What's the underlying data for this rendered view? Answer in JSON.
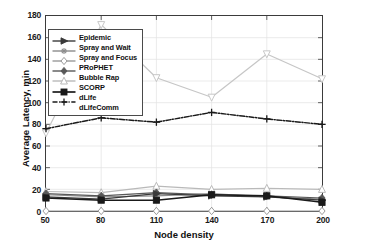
{
  "chart_data": {
    "type": "line",
    "title": "",
    "xlabel": "Node density",
    "ylabel": "Average Latency, min",
    "x": [
      50,
      80,
      110,
      140,
      170,
      200
    ],
    "xticklabels": [
      "50",
      "80",
      "110",
      "140",
      "170",
      "200"
    ],
    "yticklabels": [
      "0",
      "20",
      "40",
      "60",
      "80",
      "100",
      "120",
      "140",
      "160",
      "180"
    ],
    "yticks": [
      0,
      20,
      40,
      60,
      80,
      100,
      120,
      140,
      160,
      180
    ],
    "xlim": [
      50,
      200
    ],
    "ylim": [
      0,
      180
    ],
    "grid": true,
    "legend_position": "upper-left-inside",
    "series": [
      {
        "name": "Epidemic",
        "marker": "right-triangle",
        "linestyle": "solid",
        "color": "#3a3a3a",
        "values": [
          13,
          11,
          16,
          14,
          13,
          10
        ]
      },
      {
        "name": "Spray and Wait",
        "marker": "asterisk",
        "linestyle": "solid",
        "color": "#8c8c8c",
        "values": [
          15,
          13,
          14,
          16,
          13,
          11
        ]
      },
      {
        "name": "Spray and Focus",
        "marker": "diamond-open",
        "linestyle": "solid",
        "color": "#9a9a9a",
        "values": [
          0,
          0,
          0,
          0,
          0,
          0
        ]
      },
      {
        "name": "PRoPHET",
        "marker": "diamond-filled",
        "linestyle": "solid",
        "color": "#585858",
        "values": [
          16,
          14,
          17,
          15,
          14,
          12
        ]
      },
      {
        "name": "Bubble Rap",
        "marker": "triangle-open",
        "linestyle": "solid",
        "color": "#b9b9b9",
        "values": [
          18,
          17,
          23,
          20,
          21,
          20
        ]
      },
      {
        "name": "SCORP",
        "marker": "square-filled",
        "linestyle": "solid",
        "color": "#1a1a1a",
        "values": [
          12,
          10,
          10,
          15,
          14,
          8
        ]
      },
      {
        "name": "dLife",
        "marker": "plus",
        "linestyle": "dash-dot",
        "color": "#1a1a1a",
        "values": [
          76,
          86,
          82,
          91,
          85,
          80
        ]
      },
      {
        "name": "dLifeComm",
        "marker": "triangle-down",
        "linestyle": "solid",
        "color": "#c6c6c6",
        "values": [
          72,
          172,
          123,
          105,
          145,
          122
        ]
      }
    ]
  }
}
